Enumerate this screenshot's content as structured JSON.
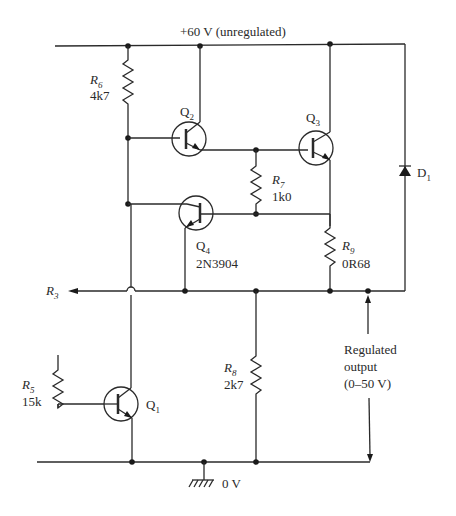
{
  "rails": {
    "supply_label": "+60 V (unregulated)",
    "ground_label": "0 V"
  },
  "components": {
    "R6": {
      "name": "R",
      "sub": "6",
      "value": "4k7"
    },
    "R7": {
      "name": "R",
      "sub": "7",
      "value": "1k0"
    },
    "R9": {
      "name": "R",
      "sub": "9",
      "value": "0R68"
    },
    "R8": {
      "name": "R",
      "sub": "8",
      "value": "2k7"
    },
    "R5": {
      "name": "R",
      "sub": "5",
      "value": "15k"
    },
    "R3": {
      "name": "R",
      "sub": "3"
    },
    "Q1": {
      "name": "Q",
      "sub": "1"
    },
    "Q2": {
      "name": "Q",
      "sub": "2"
    },
    "Q3": {
      "name": "Q",
      "sub": "3"
    },
    "Q4": {
      "name": "Q",
      "sub": "4",
      "part": "2N3904"
    },
    "D1": {
      "name": "D",
      "sub": "1"
    }
  },
  "output": {
    "line1": "Regulated",
    "line2": "output",
    "line3": "(0–50 V)"
  }
}
